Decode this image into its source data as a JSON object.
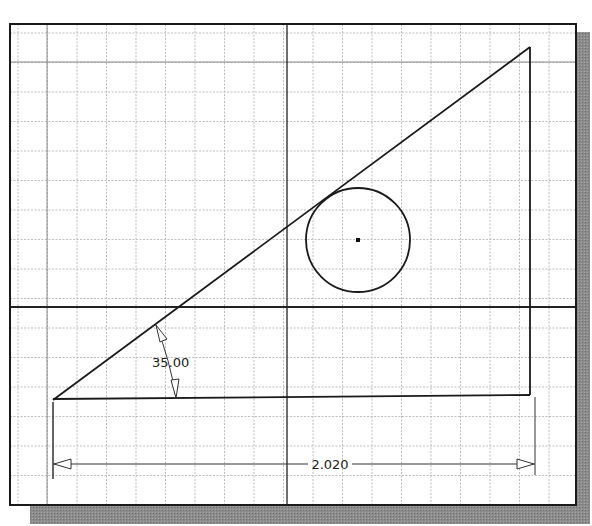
{
  "sketch": {
    "frame": {
      "x": 10,
      "y": 24,
      "width": 566,
      "height": 481
    },
    "shadow": {
      "offset_x": 20,
      "offset_y": 18,
      "color": "#8a8a8a"
    },
    "grid": {
      "spacing": 29.5,
      "origin_x": 18,
      "origin_y": 33,
      "color": "#b8b8b8"
    },
    "axes": {
      "vertical_x": 287,
      "horizontal_y": 307,
      "color": "#1a1a1a"
    },
    "triangle": {
      "points": [
        [
          53,
          400
        ],
        [
          530,
          47
        ],
        [
          530,
          395
        ]
      ],
      "bottom_line": [
        [
          53,
          399
        ],
        [
          530,
          395
        ]
      ],
      "color": "#1a1a1a"
    },
    "circle": {
      "cx": 358,
      "cy": 240,
      "r": 52,
      "center_mark": true
    },
    "dimensions": {
      "angle": {
        "value": "35.00",
        "text_x": 152,
        "text_y": 367
      },
      "linear": {
        "value": "2.020",
        "y": 464,
        "x1": 53,
        "x2": 535,
        "text_x": 330
      }
    }
  }
}
